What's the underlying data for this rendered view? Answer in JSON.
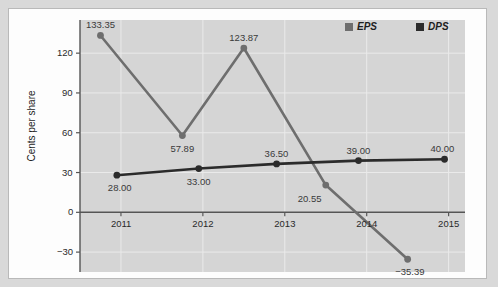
{
  "chart_data": {
    "type": "line",
    "title": "",
    "xlabel": "",
    "ylabel": "Cents per share",
    "x_tick_labels": [
      "2011",
      "2012",
      "2013",
      "2014",
      "2015"
    ],
    "y_tick_labels": [
      "120",
      "90",
      "60",
      "30",
      "0",
      "−30"
    ],
    "ylim": [
      -45,
      145
    ],
    "xlim": [
      2010.5,
      2015.2
    ],
    "grid": true,
    "legend_position": "top-right",
    "series": [
      {
        "name": "EPS",
        "color": "#6e6e6e",
        "x": [
          2010.75,
          2011.75,
          2012.5,
          2013.5,
          2014.5
        ],
        "values": [
          133.35,
          57.89,
          123.87,
          20.55,
          -35.39
        ],
        "labels": [
          "133.35",
          "57.89",
          "123.87",
          "20.55",
          "−35.39"
        ]
      },
      {
        "name": "DPS",
        "color": "#2b2b2b",
        "x": [
          2010.95,
          2011.95,
          2012.9,
          2013.9,
          2014.95
        ],
        "values": [
          28.0,
          33.0,
          36.5,
          39.0,
          40.0
        ],
        "labels": [
          "28.00",
          "33.00",
          "36.50",
          "39.00",
          "40.00"
        ]
      }
    ]
  },
  "legend": {
    "entries": [
      {
        "label": "EPS",
        "color": "#6e6e6e"
      },
      {
        "label": "DPS",
        "color": "#2b2b2b"
      }
    ]
  },
  "colors": {
    "page_background": "#d9d9d9",
    "card_background": "#fdfdfd",
    "panel_background": "#d5d5d5",
    "grid": "#eaeaea",
    "axis": "#555555",
    "eps": "#6e6e6e",
    "dps": "#2b2b2b"
  }
}
